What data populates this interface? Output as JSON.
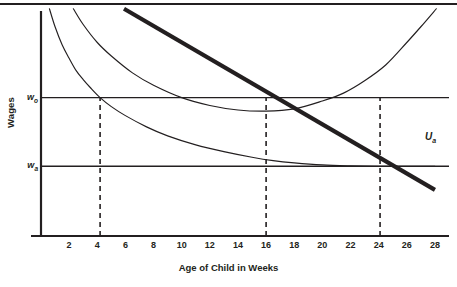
{
  "chart_data": {
    "type": "line",
    "title": "",
    "xlabel": "Age of Child in Weeks",
    "ylabel": "Wages",
    "xlim": [
      0,
      29
    ],
    "ylim": [
      0,
      10
    ],
    "grid": false,
    "legend_position": "inline-right",
    "x_ticks": [
      2,
      4,
      6,
      8,
      10,
      12,
      14,
      16,
      18,
      20,
      22,
      24,
      26,
      28
    ],
    "y_ticks": [
      {
        "label": "w",
        "sub": "o",
        "value": 6.15
      },
      {
        "label": "w",
        "sub": "a",
        "value": 3.1
      }
    ],
    "reference_lines": {
      "horizontal": [
        {
          "name": "w-o-line",
          "value": 6.15,
          "label": "w",
          "sub": "o"
        },
        {
          "name": "w-a-line",
          "value": 3.1,
          "label": "w",
          "sub": "a"
        }
      ],
      "vertical_dashed": [
        {
          "name": "dash-at-4",
          "value": 4.2
        },
        {
          "name": "dash-at-16",
          "value": 16.0
        },
        {
          "name": "dash-at-24",
          "value": 24.1
        }
      ]
    },
    "series": [
      {
        "name": "steep-decay-curve",
        "style": "thin",
        "label": "",
        "x": [
          0.6,
          1.0,
          1.5,
          2.0,
          2.5,
          3.0,
          3.5,
          4.2,
          5.0,
          6.0,
          7.5,
          9.0,
          11.0,
          13.0,
          15.0,
          16.5,
          18.0,
          20.0,
          22.0,
          24.0,
          26.0,
          28.0
        ],
        "y": [
          10.1,
          9.3,
          8.5,
          7.9,
          7.35,
          6.95,
          6.6,
          6.15,
          5.75,
          5.35,
          4.85,
          4.45,
          4.05,
          3.75,
          3.5,
          3.35,
          3.25,
          3.16,
          3.12,
          3.1,
          3.1,
          3.1
        ]
      },
      {
        "name": "u-shaped-curve",
        "style": "thin",
        "label": "U",
        "sub": "a",
        "x": [
          2.3,
          3.0,
          4.0,
          5.0,
          6.5,
          8.0,
          10.0,
          12.0,
          14.0,
          16.0,
          18.0,
          20.0,
          21.5,
          23.0,
          24.5,
          26.0,
          27.0,
          28.1
        ],
        "y": [
          10.1,
          9.4,
          8.6,
          8.0,
          7.25,
          6.7,
          6.15,
          5.8,
          5.6,
          5.55,
          5.65,
          6.0,
          6.35,
          6.9,
          7.6,
          8.6,
          9.3,
          10.1
        ]
      },
      {
        "name": "thick-budget-line",
        "style": "thick",
        "label": "",
        "x": [
          5.9,
          28.0
        ],
        "y": [
          10.1,
          2.05
        ]
      }
    ],
    "annotations": [
      {
        "name": "u-a-curve-label",
        "text": "U",
        "sub": "a",
        "x": 27.3,
        "y": 4.35
      }
    ]
  },
  "axes": {
    "y_title": "Wages",
    "x_title": "Age of Child in Weeks"
  }
}
